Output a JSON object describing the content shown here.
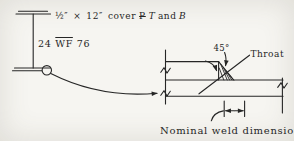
{
  "canvas": {
    "background": "#f6f5f1",
    "ink": "#262626"
  },
  "beam_note": {
    "prefix": "½″ × 12″ cover",
    "plate_symbol": "P",
    "top_flag": "T",
    "conjunction": "and",
    "bottom_flag": "B"
  },
  "section_label": {
    "depth": "24",
    "shape": "WF",
    "weight": "76"
  },
  "weld_detail": {
    "angle_label": "45°",
    "throat_label": "Throat",
    "dimension_label": "Nominal weld dimension"
  }
}
